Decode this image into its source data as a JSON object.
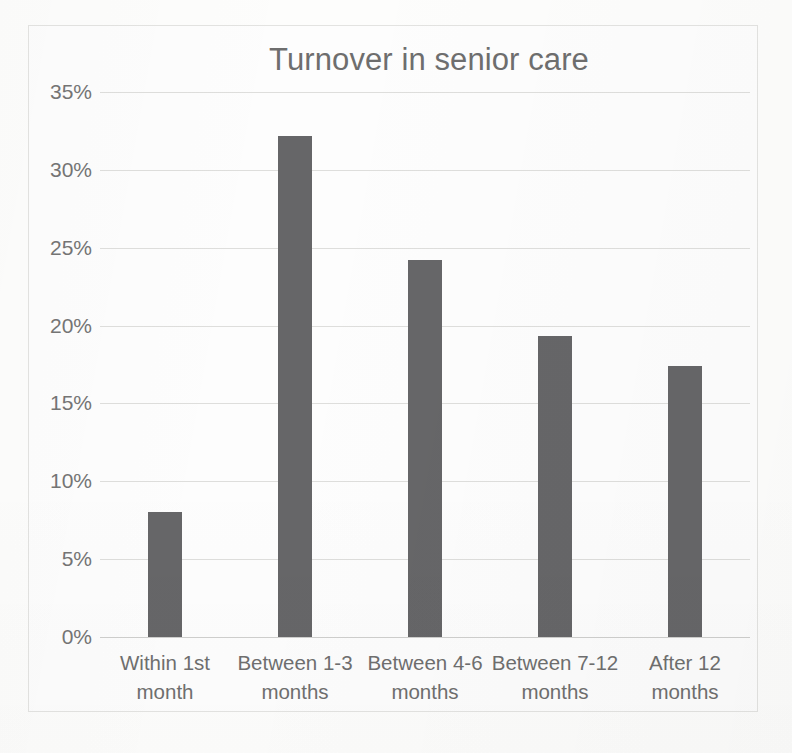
{
  "chart_data": {
    "type": "bar",
    "title": "Turnover in senior care",
    "xlabel": "",
    "ylabel": "",
    "categories": [
      "Within 1st month",
      "Between 1-3 months",
      "Between 4-6 months",
      "Between 7-12 months",
      "After 12 months"
    ],
    "category_lines": [
      [
        "Within 1st",
        "month"
      ],
      [
        "Between 1-3",
        "months"
      ],
      [
        "Between 4-6",
        "months"
      ],
      [
        "Between 7-12",
        "months"
      ],
      [
        "After 12",
        "months"
      ]
    ],
    "values": [
      8.0,
      32.2,
      24.2,
      19.3,
      17.4
    ],
    "value_labels": [
      "8%",
      "32.2%",
      "24.2%",
      "19.3%",
      "17.4%"
    ],
    "ylim": [
      0,
      35
    ],
    "ytick_values": [
      0,
      5,
      10,
      15,
      20,
      25,
      30,
      35
    ],
    "ytick_labels": [
      "0%",
      "5%",
      "10%",
      "15%",
      "20%",
      "25%",
      "30%",
      "35%"
    ],
    "grid": true,
    "legend": null,
    "legend_position": "none",
    "colors": {
      "bar": "#666668",
      "gridline": "#dededc",
      "axis": "#cfcfcd",
      "title_text": "#6e6e6e",
      "tick_text": "#757575",
      "frame_border": "#e3e3e1",
      "background": "#fdfdfd"
    }
  }
}
